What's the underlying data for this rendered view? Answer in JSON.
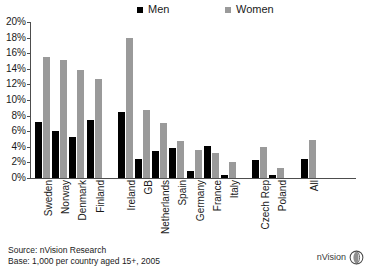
{
  "legend": {
    "entries": [
      {
        "label": "Men",
        "color": "#000000",
        "icon": "square-swatch-black"
      },
      {
        "label": "Women",
        "color": "#9a9a9a",
        "icon": "square-swatch-gray"
      }
    ]
  },
  "footer": {
    "source": "Source: nVision Research",
    "base": "Base: 1,000 per country aged 15+, 2005"
  },
  "logo": {
    "text": "nVision",
    "icon": "sphere-globe-icon"
  },
  "chart_data": {
    "type": "bar",
    "title": "",
    "xlabel": "",
    "ylabel": "",
    "ylim": [
      0,
      20
    ],
    "yticks": [
      "0%",
      "2%",
      "4%",
      "6%",
      "8%",
      "10%",
      "12%",
      "14%",
      "16%",
      "18%",
      "20%"
    ],
    "ytick_values": [
      0,
      2,
      4,
      6,
      8,
      10,
      12,
      14,
      16,
      18,
      20
    ],
    "grid": false,
    "legend_position": "top-center",
    "categories": [
      "Sweden",
      "Norway",
      "Denmark",
      "Finland",
      "Ireland",
      "GB",
      "Netherlands",
      "Spain",
      "Germany",
      "France",
      "Italy",
      "Czech Rep",
      "Poland",
      "All"
    ],
    "group_breaks_after": [
      "Finland",
      "Italy",
      "Poland"
    ],
    "series": [
      {
        "name": "Men",
        "color": "#000000",
        "values": [
          7.2,
          6.0,
          5.3,
          7.5,
          8.5,
          2.4,
          3.4,
          3.9,
          0.9,
          4.1,
          0.4,
          2.3,
          0.4,
          2.4
        ]
      },
      {
        "name": "Women",
        "color": "#9a9a9a",
        "values": [
          15.5,
          15.1,
          13.8,
          12.7,
          18.0,
          8.7,
          7.0,
          4.8,
          3.6,
          3.2,
          2.1,
          4.0,
          1.3,
          4.9
        ]
      }
    ]
  }
}
